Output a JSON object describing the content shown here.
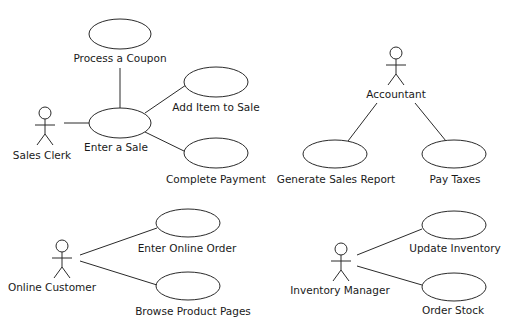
{
  "diagram": {
    "type": "UML use case diagram",
    "colors": {
      "background": "#ffffff",
      "stroke": "#2a2a2a",
      "text": "#1a1a1a"
    },
    "actors": [
      {
        "id": "sales-clerk",
        "label": "Sales Clerk",
        "x": 45,
        "y": 113,
        "label_x": 42,
        "label_y": 159
      },
      {
        "id": "accountant",
        "label": "Accountant",
        "x": 396,
        "y": 53,
        "label_x": 396,
        "label_y": 98
      },
      {
        "id": "online-customer",
        "label": "Online Customer",
        "x": 62,
        "y": 246,
        "label_x": 52,
        "label_y": 291
      },
      {
        "id": "inventory-manager",
        "label": "Inventory Manager",
        "x": 341,
        "y": 249,
        "label_x": 340,
        "label_y": 294
      }
    ],
    "use_cases": [
      {
        "id": "process-coupon",
        "label": "Process a Coupon",
        "cx": 120,
        "cy": 34,
        "rx": 31,
        "ry": 15,
        "label_x": 120,
        "label_y": 62
      },
      {
        "id": "enter-sale",
        "label": "Enter a Sale",
        "cx": 120,
        "cy": 123,
        "rx": 31,
        "ry": 15,
        "label_x": 116,
        "label_y": 151
      },
      {
        "id": "add-item",
        "label": "Add Item to Sale",
        "cx": 216,
        "cy": 82,
        "rx": 32,
        "ry": 15,
        "label_x": 216,
        "label_y": 111
      },
      {
        "id": "complete-payment",
        "label": "Complete Payment",
        "cx": 216,
        "cy": 153,
        "rx": 32,
        "ry": 15,
        "label_x": 216,
        "label_y": 183
      },
      {
        "id": "generate-report",
        "label": "Generate Sales Report",
        "cx": 335,
        "cy": 154,
        "rx": 32,
        "ry": 14,
        "label_x": 336,
        "label_y": 183
      },
      {
        "id": "pay-taxes",
        "label": "Pay Taxes",
        "cx": 454,
        "cy": 154,
        "rx": 32,
        "ry": 14,
        "label_x": 455,
        "label_y": 183
      },
      {
        "id": "enter-online-order",
        "label": "Enter Online Order",
        "cx": 188,
        "cy": 223,
        "rx": 32,
        "ry": 14,
        "label_x": 187,
        "label_y": 252
      },
      {
        "id": "browse-pages",
        "label": "Browse Product Pages",
        "cx": 188,
        "cy": 286,
        "rx": 32,
        "ry": 14,
        "label_x": 193,
        "label_y": 315
      },
      {
        "id": "update-inventory",
        "label": "Update Inventory",
        "cx": 454,
        "cy": 225,
        "rx": 32,
        "ry": 14,
        "label_x": 455,
        "label_y": 252
      },
      {
        "id": "order-stock",
        "label": "Order Stock",
        "cx": 454,
        "cy": 287,
        "rx": 32,
        "ry": 14,
        "label_x": 453,
        "label_y": 314
      }
    ],
    "associations": [
      {
        "from": "sales-clerk",
        "to": "enter-sale",
        "x1": 64,
        "y1": 123,
        "x2": 89,
        "y2": 123
      },
      {
        "from": "enter-sale",
        "to": "process-coupon",
        "x1": 120,
        "y1": 108,
        "x2": 120,
        "y2": 68
      },
      {
        "from": "enter-sale",
        "to": "add-item",
        "x1": 145,
        "y1": 113,
        "x2": 186,
        "y2": 85
      },
      {
        "from": "enter-sale",
        "to": "complete-payment",
        "x1": 145,
        "y1": 132,
        "x2": 186,
        "y2": 152
      },
      {
        "from": "accountant",
        "to": "generate-report",
        "x1": 377,
        "y1": 103,
        "x2": 348,
        "y2": 141
      },
      {
        "from": "accountant",
        "to": "pay-taxes",
        "x1": 415,
        "y1": 103,
        "x2": 446,
        "y2": 141
      },
      {
        "from": "online-customer",
        "to": "enter-online-order",
        "x1": 80,
        "y1": 255,
        "x2": 157,
        "y2": 228
      },
      {
        "from": "online-customer",
        "to": "browse-pages",
        "x1": 80,
        "y1": 261,
        "x2": 157,
        "y2": 285
      },
      {
        "from": "inventory-manager",
        "to": "update-inventory",
        "x1": 357,
        "y1": 255,
        "x2": 422,
        "y2": 229
      },
      {
        "from": "inventory-manager",
        "to": "order-stock",
        "x1": 357,
        "y1": 266,
        "x2": 422,
        "y2": 285
      }
    ]
  }
}
